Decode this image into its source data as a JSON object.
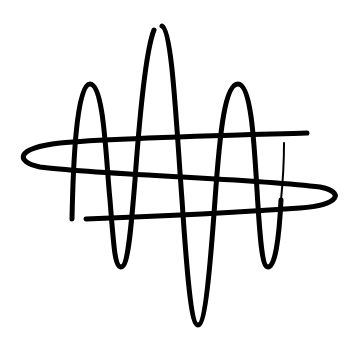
{
  "logo": {
    "description": "Abstract waveform logo: vertical sine wave interwoven with a horizontal elongated loop",
    "stroke_color": "#000000",
    "background_color": "#ffffff"
  }
}
